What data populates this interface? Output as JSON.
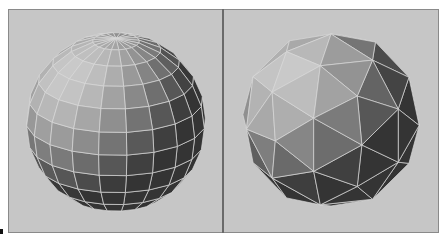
{
  "figure": {
    "panels": [
      {
        "id": "left",
        "label": "UV sphere",
        "mesh": "latitude-longitude quads",
        "center": [
          108,
          113
        ],
        "radius": 90,
        "lat_bands": 12,
        "lon_segments": 20
      },
      {
        "id": "right",
        "label": "Geodesic sphere",
        "mesh": "triangulated icosphere",
        "center": [
          107,
          111
        ],
        "radius": 90
      }
    ],
    "colors": {
      "background": "#c6c6c6",
      "frame_border": "#8a8a8a",
      "divider": "#6a6a6a",
      "wire": "#d8d8d8",
      "highlight": "#bdbdbd",
      "shade_dark": "#3e3e3e",
      "shade_mid": "#6e6e6e"
    }
  }
}
